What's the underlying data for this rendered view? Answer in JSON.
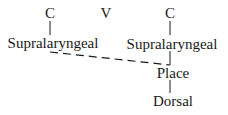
{
  "diagram": {
    "type": "feature-geometry tree",
    "top_tier": [
      {
        "label": "C"
      },
      {
        "label": "V"
      },
      {
        "label": "C"
      }
    ],
    "nodes": {
      "left_supralaryngeal": "Supralaryngeal",
      "right_supralaryngeal": "Supralaryngeal",
      "place": "Place",
      "dorsal": "Dorsal"
    },
    "edges": [
      {
        "from": "C (left)",
        "to": "Supralaryngeal (left)",
        "style": "solid"
      },
      {
        "from": "C (right)",
        "to": "Supralaryngeal (right)",
        "style": "solid"
      },
      {
        "from": "Supralaryngeal (right)",
        "to": "Place",
        "style": "solid"
      },
      {
        "from": "Place",
        "to": "Dorsal",
        "style": "solid"
      },
      {
        "from": "Supralaryngeal (left)",
        "to": "Place",
        "style": "dashed"
      }
    ]
  }
}
